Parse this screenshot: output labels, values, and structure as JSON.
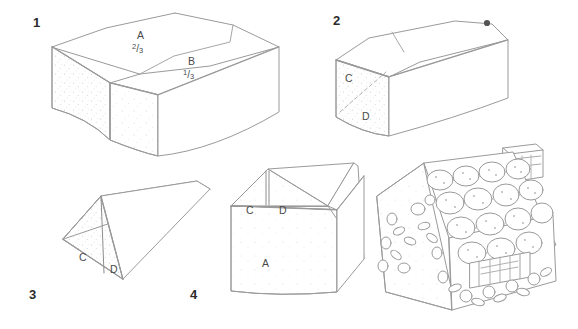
{
  "figure": {
    "type": "instructional-line-diagram",
    "background_color": "#ffffff",
    "line_color": "#9a9a9a",
    "dark_line_color": "#7d7d7d",
    "label_color": "#4a4a4a",
    "number_color": "#2b2b2b"
  },
  "steps": [
    {
      "number": "1",
      "caption": "Rectangular cake block divided into two parts",
      "shape": "rectangular-block",
      "labels": [
        {
          "id": "A",
          "text": "A",
          "fraction_numerator": "2",
          "fraction_denominator": "3",
          "fraction": "2/3"
        },
        {
          "id": "B",
          "text": "B",
          "fraction_numerator": "1",
          "fraction_denominator": "3",
          "fraction": "1/3"
        }
      ]
    },
    {
      "number": "2",
      "caption": "Long block with diagonal cut marked on end face",
      "shape": "elongated-block",
      "labels": [
        {
          "id": "C",
          "text": "C"
        },
        {
          "id": "D",
          "text": "D"
        }
      ],
      "marker": "dot",
      "cut_line_style": "dashed"
    },
    {
      "number": "3",
      "caption": "Triangular prism formed from the two wedges",
      "shape": "triangular-prism",
      "labels": [
        {
          "id": "C",
          "text": "C"
        },
        {
          "id": "D",
          "text": "D"
        }
      ]
    },
    {
      "number": "4",
      "caption": "Assembled house with roof pieces on the base",
      "shape": "house-assembly",
      "labels": [
        {
          "id": "C",
          "text": "C"
        },
        {
          "id": "D",
          "text": "D"
        },
        {
          "id": "A",
          "text": "A"
        }
      ]
    }
  ],
  "final_illustration": {
    "caption": "Finished decorated cake house",
    "elements": [
      "chimney",
      "cookie-roof-tiles",
      "lattice-window",
      "candy-decorations",
      "leaf-garland"
    ]
  }
}
